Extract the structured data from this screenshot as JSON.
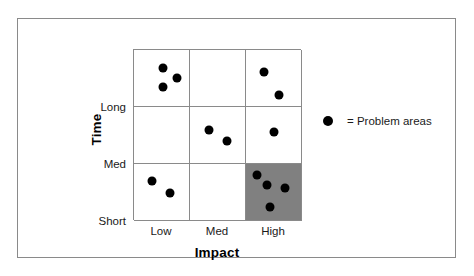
{
  "figure": {
    "frame_color": "#8a8a8a",
    "background": "#ffffff"
  },
  "legend": {
    "marker_icon": "filled-circle-icon",
    "text": "= Problem areas",
    "marker_color": "#000000"
  },
  "axes": {
    "x_title": "Impact",
    "y_title": "Time",
    "x_categories": [
      "Low",
      "Med",
      "High"
    ],
    "y_categories": [
      "Long",
      "Med",
      "Short"
    ]
  },
  "chart_data": {
    "type": "scatter",
    "title": "",
    "subtitle": "",
    "xlabel": "Impact",
    "ylabel": "Time",
    "x_categories": [
      "Low",
      "Med",
      "High"
    ],
    "y_categories": [
      "Long",
      "Med",
      "Short"
    ],
    "grid": true,
    "legend_position": "right",
    "marker_color": "#000000",
    "highlight_color": "#808080",
    "highlighted_cells": [
      {
        "x": "High",
        "y": "Short",
        "fill": "#808080"
      }
    ],
    "annotations": [
      {
        "text": "= Problem areas",
        "type": "legend-entry"
      }
    ],
    "cells": [
      {
        "x": "Low",
        "y": "Long",
        "count": 3,
        "shaded": false,
        "points": [
          {
            "cx": 29,
            "cy": 18
          },
          {
            "cx": 43,
            "cy": 28
          },
          {
            "cx": 29,
            "cy": 37
          }
        ]
      },
      {
        "x": "Med",
        "y": "Long",
        "count": 0,
        "shaded": false,
        "points": []
      },
      {
        "x": "High",
        "y": "Long",
        "count": 2,
        "shaded": false,
        "points": [
          {
            "cx": 18,
            "cy": 22
          },
          {
            "cx": 33,
            "cy": 45
          }
        ]
      },
      {
        "x": "Low",
        "y": "Med",
        "count": 0,
        "shaded": false,
        "points": []
      },
      {
        "x": "Med",
        "y": "Med",
        "count": 2,
        "shaded": false,
        "points": [
          {
            "cx": 19,
            "cy": 23
          },
          {
            "cx": 37,
            "cy": 34
          }
        ]
      },
      {
        "x": "High",
        "y": "Med",
        "count": 1,
        "shaded": false,
        "points": [
          {
            "cx": 28,
            "cy": 25
          }
        ]
      },
      {
        "x": "Low",
        "y": "Short",
        "count": 2,
        "shaded": false,
        "points": [
          {
            "cx": 18,
            "cy": 17
          },
          {
            "cx": 36,
            "cy": 29
          }
        ]
      },
      {
        "x": "Med",
        "y": "Short",
        "count": 0,
        "shaded": false,
        "points": []
      },
      {
        "x": "High",
        "y": "Short",
        "count": 4,
        "shaded": true,
        "points": [
          {
            "cx": 11,
            "cy": 11
          },
          {
            "cx": 21,
            "cy": 21
          },
          {
            "cx": 39,
            "cy": 24
          },
          {
            "cx": 24,
            "cy": 43
          }
        ]
      }
    ],
    "totals": {
      "points": 14
    }
  }
}
